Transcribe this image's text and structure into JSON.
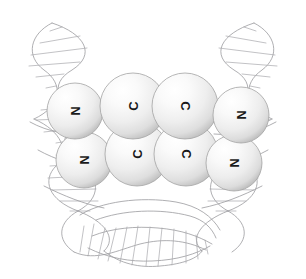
{
  "figure": {
    "background_color": "#ffffff",
    "width": 306,
    "height": 279
  },
  "molecule": {
    "label": "molecule-model",
    "bond_color": "#3c3c3c",
    "bond_highlight_color": "#d8d8d8",
    "sphere_fill": "#f2f2f2",
    "sphere_highlight": "#ffffff",
    "sphere_shadow": "#b8b8b8",
    "sphere_outline": "#9b9b9b",
    "label_color": "#1a1a1a",
    "atoms": [
      {
        "id": "atom-top-left-n",
        "element": "N",
        "cx": 75,
        "cy": 111,
        "r": 28,
        "rotation": 90,
        "row": "top",
        "order": 1
      },
      {
        "id": "atom-top-c1",
        "element": "C",
        "cx": 133,
        "cy": 106,
        "r": 33,
        "rotation": -90,
        "row": "top",
        "order": 2
      },
      {
        "id": "atom-top-c2",
        "element": "C",
        "cx": 185,
        "cy": 106,
        "r": 33,
        "rotation": 90,
        "row": "top",
        "order": 3
      },
      {
        "id": "atom-top-right-n",
        "element": "N",
        "cx": 241,
        "cy": 115,
        "r": 28,
        "rotation": 90,
        "row": "top",
        "order": 4
      },
      {
        "id": "atom-bot-left-n",
        "element": "N",
        "cx": 84,
        "cy": 160,
        "r": 28,
        "rotation": 90,
        "row": "bottom",
        "order": 1
      },
      {
        "id": "atom-bot-c1",
        "element": "C",
        "cx": 137,
        "cy": 154,
        "r": 32,
        "rotation": -90,
        "row": "bottom",
        "order": 2
      },
      {
        "id": "atom-bot-c2",
        "element": "C",
        "cx": 186,
        "cy": 154,
        "r": 32,
        "rotation": 90,
        "row": "bottom",
        "order": 3
      },
      {
        "id": "atom-bot-right-n",
        "element": "N",
        "cx": 234,
        "cy": 163,
        "r": 28,
        "rotation": 90,
        "row": "bottom",
        "order": 4
      }
    ],
    "bonds": [
      {
        "id": "bond-top-left",
        "from": "atom-top-left-n",
        "to": "atom-top-c1",
        "x1": 90,
        "y1": 110,
        "x2": 122,
        "y2": 107
      },
      {
        "id": "bond-top-right",
        "from": "atom-top-c2",
        "to": "atom-top-right-n",
        "x1": 200,
        "y1": 108,
        "x2": 232,
        "y2": 114
      },
      {
        "id": "bond-bot-left",
        "from": "atom-bot-left-n",
        "to": "atom-bot-c1",
        "x1": 96,
        "y1": 158,
        "x2": 126,
        "y2": 154
      },
      {
        "id": "bond-bot-right",
        "from": "atom-bot-c2",
        "to": "atom-bot-right-n",
        "x1": 200,
        "y1": 156,
        "x2": 228,
        "y2": 161
      }
    ]
  },
  "dna": {
    "label": "dna-double-helix",
    "strand_color": "#9a9a9e",
    "rung_color": "#a8a8ac",
    "stroke_width": 0.8,
    "description": "Thin grey outline double helix bent into a U / horseshoe shape behind the molecule"
  }
}
